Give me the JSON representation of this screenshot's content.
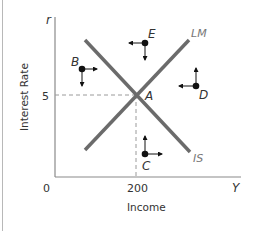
{
  "diagram": {
    "type": "IS-LM",
    "axes": {
      "y_symbol": "r",
      "x_symbol": "Y",
      "origin": "0",
      "ylabel": "Interest Rate",
      "xlabel": "Income",
      "y_tick": "5",
      "x_tick": "200"
    },
    "curves": [
      {
        "name": "LM",
        "label": "LM",
        "slope": "upward"
      },
      {
        "name": "IS",
        "label": "IS",
        "slope": "downward"
      }
    ],
    "equilibrium": {
      "label": "A",
      "r": 5,
      "Y": 200
    },
    "points": [
      {
        "label": "B",
        "arrows": [
          "right",
          "down"
        ]
      },
      {
        "label": "E",
        "arrows": [
          "left",
          "down"
        ]
      },
      {
        "label": "D",
        "arrows": [
          "left",
          "up"
        ]
      },
      {
        "label": "C",
        "arrows": [
          "up",
          "right"
        ]
      }
    ],
    "colors": {
      "curve": "#6b6b6b",
      "axis": "#8a8a8a",
      "dashed": "#9a9a9a",
      "point": "#111111",
      "text": "#333333",
      "curve_label": "#777777"
    }
  }
}
